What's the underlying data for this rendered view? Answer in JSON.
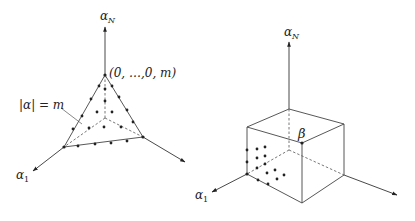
{
  "left_figure": {
    "name": "simplex",
    "axis_labels": {
      "top": "α",
      "top_sub": "N",
      "left": "α",
      "left_sub": "1"
    },
    "apex_label": "(0, …,0, m)",
    "surface_label": "|α| = m"
  },
  "right_figure": {
    "name": "box",
    "axis_labels": {
      "top": "α",
      "top_sub": "N",
      "left": "α",
      "left_sub": "1"
    },
    "corner_label": "β"
  },
  "colors": {
    "ink": "#222222",
    "background": "#ffffff"
  }
}
